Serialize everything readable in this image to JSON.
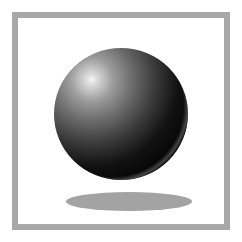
{
  "scene": {
    "description": "Framed illustration of a glossy black sphere floating above its elliptical shadow",
    "frame_color": "#a8a8a8",
    "background_color": "#ffffff",
    "sphere": {
      "highlight_color": "#f4f4f4",
      "body_color": "#000000",
      "rim_light_color": "#787878"
    },
    "shadow_color": "#a3a3a3"
  }
}
